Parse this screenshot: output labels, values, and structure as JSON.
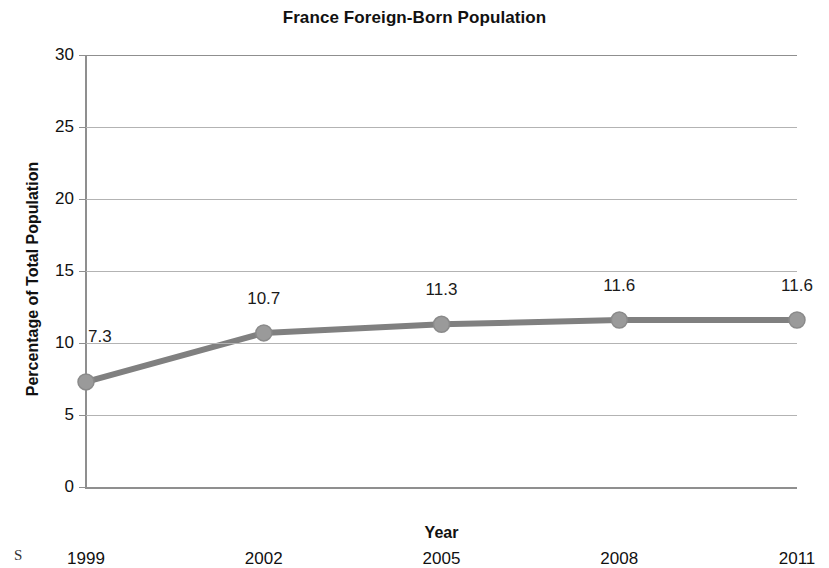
{
  "chart_data": {
    "type": "line",
    "title": "France Foreign-Born Population",
    "xlabel": "Year",
    "ylabel": "Percentage of Total Population",
    "categories": [
      "1999",
      "2002",
      "2005",
      "2008",
      "2011"
    ],
    "values": [
      7.3,
      10.7,
      11.3,
      11.6,
      11.6
    ],
    "data_labels": [
      "7.3",
      "10.7",
      "11.3",
      "11.6",
      "11.6"
    ],
    "ylim": [
      0,
      30
    ],
    "ytick_labels": [
      "0",
      "5",
      "10",
      "15",
      "20",
      "25",
      "30"
    ],
    "ytick_values": [
      0,
      5,
      10,
      15,
      20,
      25,
      30
    ],
    "grid": "horizontal",
    "legend": "none",
    "series_color": "#808080",
    "marker_color": "#9a9a9a",
    "gridline_color": "#b3b3b3",
    "axis_color": "#8f8f8f",
    "series": [
      {
        "name": "France Foreign-Born Population",
        "values": [
          7.3,
          10.7,
          11.3,
          11.6,
          11.6
        ]
      }
    ]
  },
  "footer": {
    "source_fragment": "S"
  }
}
